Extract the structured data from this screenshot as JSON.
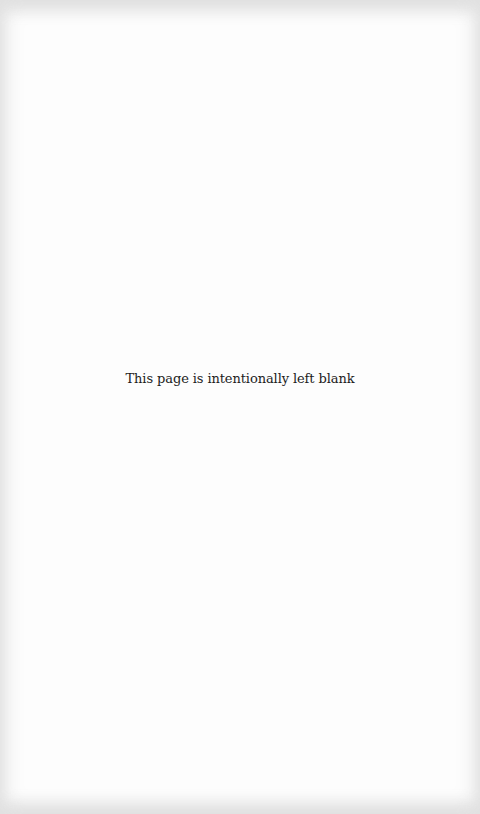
{
  "page": {
    "notice_text": "This page is intentionally left blank",
    "background_color": "#fdfdfd",
    "text_color": "#1c1c1c"
  }
}
